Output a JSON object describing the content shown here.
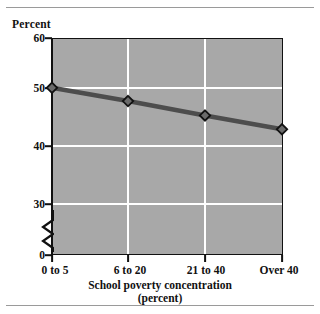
{
  "chart_data": {
    "type": "line",
    "title": "",
    "xlabel": "School poverty concentration (percent)",
    "xlabel_line1": "School poverty concentration",
    "xlabel_line2": "(percent)",
    "ylabel": "Percent",
    "categories": [
      "0 to 5",
      "6 to 20",
      "21 to 40",
      "Over 40"
    ],
    "values": [
      51,
      48.6,
      46,
      43.5
    ],
    "series": [
      {
        "name": "Percent",
        "values": [
          51,
          48.6,
          46,
          43.5
        ]
      }
    ],
    "ylim": [
      0,
      60
    ],
    "yticks": [
      0,
      30,
      40,
      50,
      60
    ],
    "ytick_labels": [
      "0",
      "30",
      "40",
      "50",
      "60"
    ],
    "gridlines": true,
    "gridline_color": "#ffffff",
    "y_axis_broken": true,
    "y_axis_break_between": [
      0,
      30
    ],
    "legend": "none",
    "plot_background": "#a8a8a8",
    "line_color": "#4d4d4d",
    "marker": "diamond",
    "marker_fill": "#6b6b6b",
    "marker_edge": "#111111"
  },
  "axis": {
    "y_title": "Percent",
    "x_title_line1": "School poverty concentration",
    "x_title_line2": "(percent)",
    "y_labels": [
      "60",
      "50",
      "40",
      "30",
      "0"
    ],
    "x_labels": [
      "0 to 5",
      "6 to 20",
      "21 to 40",
      "Over 40"
    ]
  }
}
